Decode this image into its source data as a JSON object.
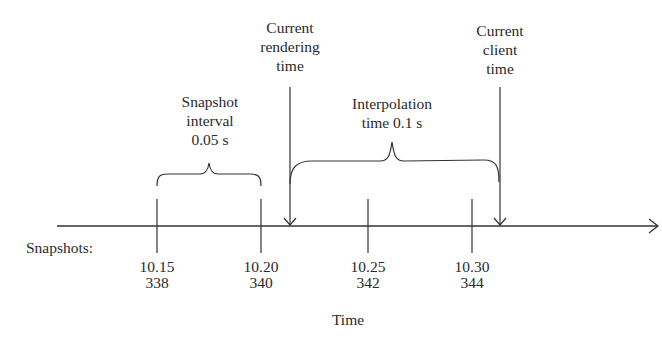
{
  "diagram": {
    "axis_label": "Time",
    "row_label": "Snapshots:",
    "snapshot_interval": {
      "line1": "Snapshot",
      "line2": "interval",
      "line3": "0.05 s"
    },
    "interpolation": {
      "line1": "Interpolation",
      "line2": "time 0.1 s"
    },
    "current_rendering_time": {
      "line1": "Current",
      "line2": "rendering",
      "line3": "time"
    },
    "current_client_time": {
      "line1": "Current",
      "line2": "client",
      "line3": "time"
    },
    "ticks": [
      {
        "time": "10.15",
        "snapshot": "338"
      },
      {
        "time": "10.20",
        "snapshot": "340"
      },
      {
        "time": "10.25",
        "snapshot": "342"
      },
      {
        "time": "10.30",
        "snapshot": "344"
      }
    ],
    "colors": {
      "line": "#333333",
      "background": "#ffffff"
    }
  }
}
